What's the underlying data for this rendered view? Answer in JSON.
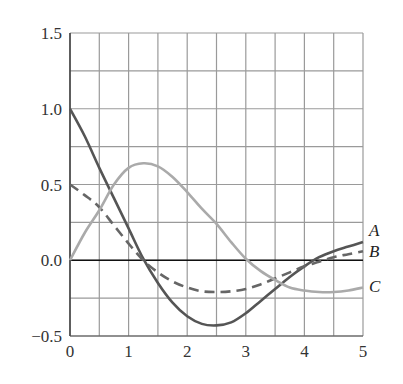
{
  "chart_data": {
    "type": "line",
    "title": "",
    "xlabel": "",
    "ylabel": "",
    "xlim": [
      0,
      5
    ],
    "ylim": [
      -0.5,
      1.5
    ],
    "grid": true,
    "x_ticks": [
      "0",
      "1",
      "2",
      "3",
      "4",
      "5"
    ],
    "y_ticks": [
      "1.5",
      "1.0",
      "0.5",
      "0.0",
      "−0.5"
    ],
    "legend_position": "right-end labels",
    "series": [
      {
        "name": "A",
        "style": "solid",
        "color": "#555555",
        "x": [
          0,
          0.25,
          0.5,
          0.75,
          1.0,
          1.25,
          1.5,
          1.75,
          2.0,
          2.25,
          2.5,
          2.75,
          3.0,
          3.25,
          3.5,
          3.75,
          4.0,
          4.25,
          4.5,
          4.75,
          5.0
        ],
        "values": [
          1.0,
          0.82,
          0.61,
          0.41,
          0.21,
          0.01,
          -0.15,
          -0.28,
          -0.37,
          -0.42,
          -0.43,
          -0.41,
          -0.35,
          -0.27,
          -0.19,
          -0.11,
          -0.04,
          0.02,
          0.06,
          0.09,
          0.12
        ]
      },
      {
        "name": "B",
        "style": "dashed",
        "color": "#666666",
        "x": [
          0,
          0.25,
          0.5,
          0.75,
          1.0,
          1.25,
          1.5,
          1.75,
          2.0,
          2.25,
          2.5,
          2.75,
          3.0,
          3.25,
          3.5,
          3.75,
          4.0,
          4.25,
          4.5,
          4.75,
          5.0
        ],
        "values": [
          0.5,
          0.43,
          0.35,
          0.23,
          0.11,
          0.0,
          -0.08,
          -0.14,
          -0.18,
          -0.205,
          -0.21,
          -0.205,
          -0.19,
          -0.16,
          -0.12,
          -0.08,
          -0.04,
          -0.01,
          0.02,
          0.04,
          0.06
        ]
      },
      {
        "name": "C",
        "style": "solid",
        "color": "#aaaaaa",
        "x": [
          0,
          0.25,
          0.5,
          0.75,
          1.0,
          1.25,
          1.5,
          1.75,
          2.0,
          2.25,
          2.5,
          2.75,
          3.0,
          3.25,
          3.5,
          3.75,
          4.0,
          4.25,
          4.5,
          4.75,
          5.0
        ],
        "values": [
          0.0,
          0.18,
          0.33,
          0.5,
          0.61,
          0.64,
          0.62,
          0.55,
          0.45,
          0.34,
          0.24,
          0.12,
          0.01,
          -0.07,
          -0.13,
          -0.18,
          -0.2,
          -0.21,
          -0.21,
          -0.2,
          -0.18
        ]
      }
    ]
  }
}
